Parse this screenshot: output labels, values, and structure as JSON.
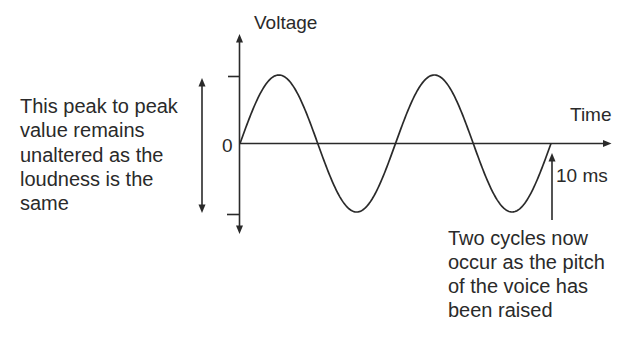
{
  "figure": {
    "y_axis": {
      "label": "Voltage",
      "origin_label": "0"
    },
    "x_axis": {
      "label": "Time"
    },
    "waveform": {
      "shape": "sine",
      "cycles": 2
    },
    "period_marker": {
      "label": "10 ms"
    },
    "annotations": {
      "amplitude_note": {
        "lines": [
          "This peak to peak",
          "value remains",
          "unaltered as the",
          "loudness is the",
          "same"
        ]
      },
      "pitch_note": {
        "lines": [
          "Two cycles now",
          "occur as the pitch",
          "of the voice has",
          "been raised"
        ]
      }
    },
    "colors": {
      "ink": "#2a2a2a",
      "background": "#ffffff"
    }
  }
}
